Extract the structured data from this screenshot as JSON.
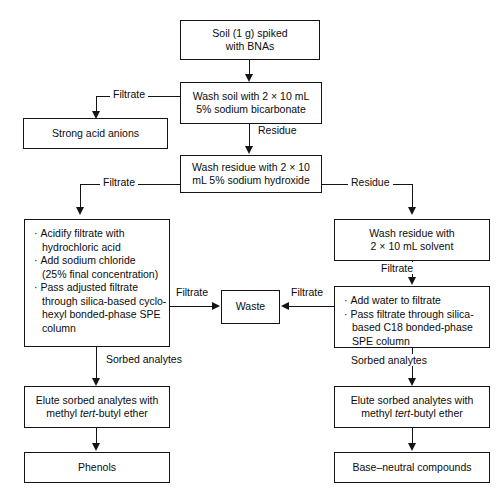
{
  "diagram": {
    "line_color": "#141414",
    "background": "#ffffff",
    "nodes": {
      "start": {
        "line1": "Soil (1 g) spiked",
        "line2": "with BNAs"
      },
      "wash_soil": {
        "line1": "Wash soil with 2 × 10 mL",
        "line2": "5% sodium bicarbonate"
      },
      "strong_acid_anions": {
        "line1": "Strong acid anions"
      },
      "wash_residue_naoh": {
        "line1": "Wash residue with 2 × 10",
        "line2": "mL 5% sodium hydroxide"
      },
      "acidify_spe": {
        "bullets": [
          {
            "text": "Acidify filtrate with",
            "cont": "hydrochloric acid"
          },
          {
            "text": "Add sodium chloride",
            "cont": "(25% final concentration)"
          },
          {
            "text": "Pass adjusted filtrate",
            "cont": "through  silica-based cyclo-",
            "cont2": "hexyl bonded-phase SPE",
            "cont3": "column"
          }
        ]
      },
      "wash_residue_solvent": {
        "line1": "Wash residue with",
        "line2": "2 × 10 mL solvent"
      },
      "add_water_spe": {
        "bullets": [
          {
            "text": "Add water to filtrate"
          },
          {
            "text": "Pass filtrate through silica-",
            "cont": "based C18 bonded-phase",
            "cont2": "SPE column"
          }
        ]
      },
      "waste": {
        "line1": "Waste"
      },
      "elute_left": {
        "line1": "Elute sorbed analytes with",
        "line2_a": "methyl ",
        "line2_i": "tert",
        "line2_b": "-butyl ether"
      },
      "elute_right": {
        "line1": "Elute sorbed analytes with",
        "line2_a": "methyl ",
        "line2_i": "tert",
        "line2_b": "-butyl ether"
      },
      "phenols": {
        "line1": "Phenols"
      },
      "base_neutral": {
        "line1": "Base–neutral compounds"
      }
    },
    "edge_labels": {
      "filtrate_bicarb": "Filtrate",
      "residue_bicarb": "Residue",
      "filtrate_naoh": "Filtrate",
      "residue_naoh": "Residue",
      "filtrate_left_waste": "Filtrate",
      "filtrate_right_waste": "Filtrate",
      "filtrate_solvent": "Filtrate",
      "sorbed_left": "Sorbed analytes",
      "sorbed_right": "Sorbed analytes"
    }
  }
}
